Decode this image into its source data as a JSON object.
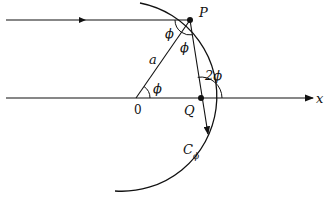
{
  "diagram": {
    "labels": {
      "point_P": "P",
      "point_Q": "Q",
      "origin": "0",
      "radius": "a",
      "axis_x": "x",
      "angle_phi_1": "ϕ",
      "angle_phi_2": "ϕ",
      "angle_phi_center": "ϕ",
      "angle_2phi": "2ϕ",
      "caustic_C": "C",
      "caustic_sub": "ϕ"
    },
    "colors": {
      "stroke": "#111111",
      "background": "#ffffff"
    }
  }
}
